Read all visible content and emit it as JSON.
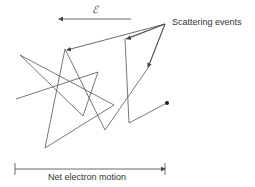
{
  "diagram": {
    "field_symbol": "ℰ",
    "scattering_label": "Scattering events",
    "net_motion_label": "Net electron motion",
    "line_color": "#444444"
  }
}
